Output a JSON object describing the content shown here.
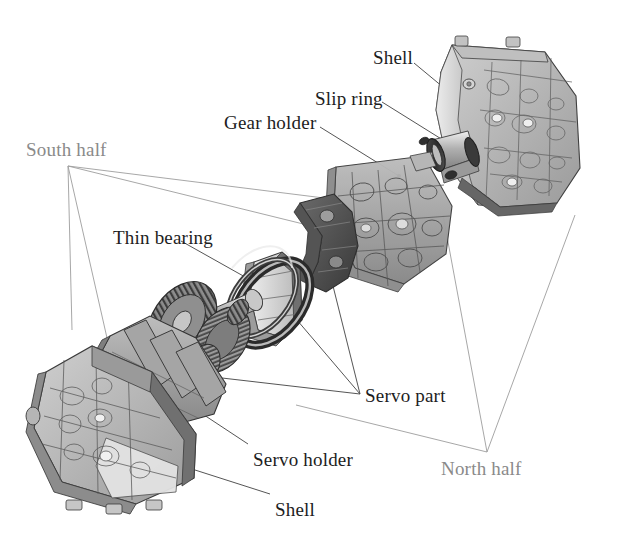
{
  "figure": {
    "background_color": "#ffffff",
    "width": 622,
    "height": 546
  },
  "style": {
    "label_color": "#1d1d1d",
    "soft_label_color": "#8a8a8a",
    "leader_line_color": "#4a4a4a",
    "soft_leader_line_color": "#9a9a9a",
    "part_fill_light": "#d8d8d8",
    "part_fill_mid": "#a8a8a8",
    "part_fill_dark": "#6d6d6d",
    "part_fill_darker": "#4a4a4a",
    "part_outline": "#3a3a3a"
  },
  "labels": [
    {
      "id": "shell-north",
      "text": "Shell",
      "x": 373,
      "y": 48,
      "tone": "dark"
    },
    {
      "id": "slip-ring",
      "text": "Slip ring",
      "x": 315,
      "y": 89,
      "tone": "dark"
    },
    {
      "id": "gear-holder",
      "text": "Gear holder",
      "x": 224,
      "y": 113,
      "tone": "dark"
    },
    {
      "id": "south-half",
      "text": "South half",
      "x": 26,
      "y": 140,
      "tone": "soft"
    },
    {
      "id": "thin-bearing",
      "text": "Thin bearing",
      "x": 113,
      "y": 228,
      "tone": "dark"
    },
    {
      "id": "servo-part",
      "text": "Servo part",
      "x": 365,
      "y": 386,
      "tone": "dark"
    },
    {
      "id": "servo-holder",
      "text": "Servo holder",
      "x": 253,
      "y": 450,
      "tone": "dark"
    },
    {
      "id": "north-half",
      "text": "North half",
      "x": 441,
      "y": 459,
      "tone": "soft"
    },
    {
      "id": "shell-south",
      "text": "Shell",
      "x": 275,
      "y": 500,
      "tone": "dark"
    }
  ],
  "parts": [
    {
      "id": "north-shell",
      "name": "North half shell",
      "description": "large faceted housing, upper right"
    },
    {
      "id": "slip-ring",
      "name": "Slip ring",
      "description": "cylindrical shaft with dark collar rings"
    },
    {
      "id": "gear-holder",
      "name": "Gear holder",
      "description": "triangular perforated frame, upper middle"
    },
    {
      "id": "servo-part-up",
      "name": "Servo part (upper)",
      "description": "curved bracket below gear holder"
    },
    {
      "id": "thin-bearing",
      "name": "Thin bearing",
      "description": "dark slender ring, centre"
    },
    {
      "id": "gear-stack",
      "name": "Gear stack",
      "description": "toothed gears on shaft"
    },
    {
      "id": "servo-holder",
      "name": "Servo holder",
      "description": "ribbed block, lower middle"
    },
    {
      "id": "south-shell",
      "name": "South half shell",
      "description": "large faceted housing, lower left"
    }
  ],
  "leaders": {
    "south_half_anchor": {
      "x": 68,
      "y": 166
    },
    "north_half_anchor": {
      "x": 487,
      "y": 452
    },
    "servo_part_anchor": {
      "x": 360,
      "y": 394
    }
  }
}
